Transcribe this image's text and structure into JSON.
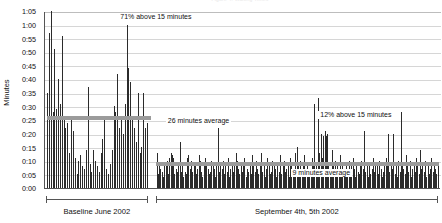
{
  "chart_data": {
    "type": "bar",
    "title": "Figure 4. Waiting Times",
    "xlabel": "",
    "ylabel": "Minutes",
    "ylim": [
      0,
      65
    ],
    "ytick_labels": [
      "0:00",
      "0:05",
      "0:10",
      "0:15",
      "0:20",
      "0:25",
      "0:30",
      "0:35",
      "0:40",
      "0:45",
      "0:50",
      "0:55",
      "1:00",
      "1:05"
    ],
    "ytick_values": [
      0,
      5,
      10,
      15,
      20,
      25,
      30,
      35,
      40,
      45,
      50,
      55,
      60,
      65
    ],
    "grid": true,
    "legend": "none",
    "annotations": [
      {
        "text": "71% above 15 minutes",
        "x_frac": 0.185,
        "y_value": 63
      },
      {
        "text": "12% above 15 minutes",
        "x_frac": 0.69,
        "y_value": 27
      },
      {
        "text": "26 minutes average",
        "x_frac": 0.305,
        "y_value": 25
      },
      {
        "text": "9 minutes average",
        "x_frac": 0.62,
        "y_value": 6
      }
    ],
    "reference_lines": [
      {
        "label": "26 minutes average",
        "value": 26,
        "x_start_frac": 0.005,
        "x_end_frac": 0.268,
        "color": "#9b9b9b"
      },
      {
        "label": "9 minutes average",
        "value": 9,
        "x_start_frac": 0.28,
        "x_end_frac": 0.995,
        "color": "#9b9b9b"
      }
    ],
    "groups": [
      {
        "label": "Baseline June 2002",
        "start_frac": 0.005,
        "end_frac": 0.262
      },
      {
        "label": "September 4th, 5th 2002",
        "start_frac": 0.282,
        "end_frac": 0.995
      }
    ],
    "series": [
      {
        "name": "Baseline June 2002",
        "values": [
          35,
          57,
          65,
          28,
          51,
          29,
          40,
          31,
          56,
          26,
          22,
          24,
          13,
          26,
          21,
          11,
          5,
          10,
          12,
          8,
          7,
          14,
          37,
          9,
          6,
          14,
          10,
          8,
          6,
          13,
          18,
          25,
          7,
          5,
          9,
          14,
          30,
          28,
          42,
          22,
          26,
          20,
          31,
          60,
          44,
          39,
          25,
          22,
          17,
          35,
          13,
          15,
          35,
          22,
          24
        ]
      },
      {
        "name": "September 4th, 5th 2002",
        "values": [
          13,
          5,
          9,
          7,
          6,
          4,
          9,
          8,
          10,
          5,
          11,
          13,
          12,
          11,
          5,
          7,
          6,
          8,
          17,
          6,
          9,
          4,
          6,
          5,
          11,
          12,
          7,
          10,
          6,
          8,
          9,
          5,
          7,
          12,
          10,
          6,
          4,
          9,
          11,
          8,
          7,
          5,
          6,
          10,
          9,
          7,
          4,
          8,
          22,
          6,
          9,
          7,
          10,
          5,
          8,
          6,
          11,
          4,
          7,
          9,
          6,
          8,
          13,
          10,
          7,
          5,
          9,
          6,
          8,
          11,
          4,
          7,
          6,
          9,
          5,
          12,
          8,
          6,
          10,
          7,
          5,
          9,
          13,
          6,
          8,
          4,
          7,
          11,
          9,
          5,
          6,
          10,
          8,
          7,
          4,
          9,
          6,
          12,
          5,
          8,
          10,
          6,
          7,
          9,
          4,
          11,
          8,
          5,
          6,
          13,
          15,
          9,
          7,
          10,
          6,
          8,
          12,
          5,
          9,
          7,
          4,
          6,
          11,
          8,
          31,
          9,
          6,
          33,
          13,
          20,
          11,
          19,
          21,
          19,
          20,
          9,
          7,
          6,
          14,
          8,
          10,
          5,
          9,
          7,
          12,
          6,
          8,
          4,
          7,
          9,
          5,
          10,
          6,
          8,
          11,
          7,
          4,
          9,
          6,
          5,
          8,
          10,
          7,
          21,
          6,
          9,
          4,
          8,
          5,
          7,
          11,
          6,
          9,
          8,
          5,
          10,
          7,
          4,
          6,
          9,
          11,
          8,
          20,
          6,
          9,
          7,
          20,
          5,
          8,
          4,
          10,
          6,
          28,
          9,
          7,
          5,
          12,
          8,
          6,
          10,
          4,
          7,
          9,
          6,
          11,
          8,
          5,
          14,
          7,
          9,
          6,
          10,
          4,
          8,
          5,
          7,
          11,
          6,
          9,
          7,
          5,
          8
        ]
      }
    ]
  }
}
